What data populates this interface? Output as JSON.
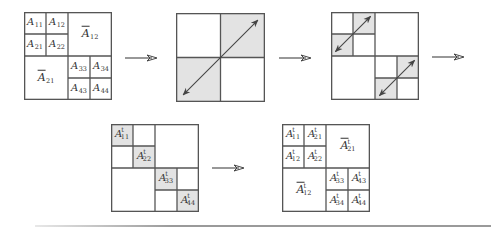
{
  "colors": {
    "line": "#555555",
    "shade": "#e3e3e3",
    "arrow": "#444444",
    "label": "#333333",
    "rule": "#9a9a9a"
  },
  "panels": [
    {
      "id": "step-1-original-blocks",
      "x": 24,
      "y": 12,
      "size": 88,
      "grid": "two-level",
      "shaded": [],
      "diagonal_arrows": [],
      "labels": [
        {
          "base": "A",
          "sub": "11",
          "sup": "",
          "bar": false,
          "cx": 0.125,
          "cy": 0.125
        },
        {
          "base": "A",
          "sub": "12",
          "sup": "",
          "bar": false,
          "cx": 0.375,
          "cy": 0.125
        },
        {
          "base": "A",
          "sub": "21",
          "sup": "",
          "bar": false,
          "cx": 0.125,
          "cy": 0.375
        },
        {
          "base": "A",
          "sub": "22",
          "sup": "",
          "bar": false,
          "cx": 0.375,
          "cy": 0.375
        },
        {
          "base": "A",
          "sub": "12",
          "sup": "",
          "bar": true,
          "cx": 0.75,
          "cy": 0.25,
          "big": true
        },
        {
          "base": "A",
          "sub": "21",
          "sup": "",
          "bar": true,
          "cx": 0.25,
          "cy": 0.75,
          "big": true
        },
        {
          "base": "A",
          "sub": "33",
          "sup": "",
          "bar": false,
          "cx": 0.625,
          "cy": 0.625
        },
        {
          "base": "A",
          "sub": "34",
          "sup": "",
          "bar": false,
          "cx": 0.875,
          "cy": 0.625
        },
        {
          "base": "A",
          "sub": "43",
          "sup": "",
          "bar": false,
          "cx": 0.625,
          "cy": 0.875
        },
        {
          "base": "A",
          "sub": "44",
          "sup": "",
          "bar": false,
          "cx": 0.875,
          "cy": 0.875
        }
      ]
    },
    {
      "id": "step-2-swap-offdiagonal-blocks",
      "x": 176,
      "y": 13,
      "size": 89,
      "grid": "one-level",
      "shaded": [
        [
          0.5,
          0,
          0.5,
          0.5
        ],
        [
          0,
          0.5,
          0.5,
          0.5
        ]
      ],
      "diagonal_arrows": [
        [
          0.08,
          0.92,
          0.92,
          0.08
        ]
      ],
      "labels": []
    },
    {
      "id": "step-3-swap-subblocks",
      "x": 331,
      "y": 12,
      "size": 88,
      "grid": "block-diagonal",
      "shaded": [
        [
          0.25,
          0,
          0.25,
          0.25
        ],
        [
          0,
          0.25,
          0.25,
          0.25
        ],
        [
          0.75,
          0.5,
          0.25,
          0.25
        ],
        [
          0.5,
          0.75,
          0.25,
          0.25
        ]
      ],
      "diagonal_arrows": [
        [
          0.05,
          0.45,
          0.45,
          0.05
        ],
        [
          0.55,
          0.95,
          0.95,
          0.55
        ]
      ],
      "labels": []
    },
    {
      "id": "step-4-transpose-diagonal-blocks",
      "x": 111,
      "y": 124,
      "size": 88,
      "grid": "block-diagonal",
      "shaded": [
        [
          0,
          0,
          0.25,
          0.25
        ],
        [
          0.25,
          0.25,
          0.25,
          0.25
        ],
        [
          0.5,
          0.5,
          0.25,
          0.25
        ],
        [
          0.75,
          0.75,
          0.25,
          0.25
        ]
      ],
      "diagonal_arrows": [],
      "labels": [
        {
          "base": "A",
          "sub": "11",
          "sup": "t",
          "bar": false,
          "cx": 0.125,
          "cy": 0.125
        },
        {
          "base": "A",
          "sub": "22",
          "sup": "t",
          "bar": false,
          "cx": 0.375,
          "cy": 0.375
        },
        {
          "base": "A",
          "sub": "33",
          "sup": "t",
          "bar": false,
          "cx": 0.625,
          "cy": 0.625
        },
        {
          "base": "A",
          "sub": "44",
          "sup": "t",
          "bar": false,
          "cx": 0.875,
          "cy": 0.875
        }
      ]
    },
    {
      "id": "step-5-transposed-result",
      "x": 282,
      "y": 124,
      "size": 88,
      "grid": "two-level",
      "shaded": [],
      "diagonal_arrows": [],
      "labels": [
        {
          "base": "A",
          "sub": "11",
          "sup": "t",
          "bar": false,
          "cx": 0.125,
          "cy": 0.125
        },
        {
          "base": "A",
          "sub": "21",
          "sup": "t",
          "bar": false,
          "cx": 0.375,
          "cy": 0.125
        },
        {
          "base": "A",
          "sub": "12",
          "sup": "t",
          "bar": false,
          "cx": 0.125,
          "cy": 0.375
        },
        {
          "base": "A",
          "sub": "22",
          "sup": "t",
          "bar": false,
          "cx": 0.375,
          "cy": 0.375
        },
        {
          "base": "A",
          "sub": "21",
          "sup": "t",
          "bar": true,
          "cx": 0.75,
          "cy": 0.25,
          "big": true
        },
        {
          "base": "A",
          "sub": "12",
          "sup": "t",
          "bar": true,
          "cx": 0.25,
          "cy": 0.75,
          "big": true
        },
        {
          "base": "A",
          "sub": "33",
          "sup": "t",
          "bar": false,
          "cx": 0.625,
          "cy": 0.625
        },
        {
          "base": "A",
          "sub": "43",
          "sup": "t",
          "bar": false,
          "cx": 0.875,
          "cy": 0.625
        },
        {
          "base": "A",
          "sub": "34",
          "sup": "t",
          "bar": false,
          "cx": 0.625,
          "cy": 0.875
        },
        {
          "base": "A",
          "sub": "44",
          "sup": "t",
          "bar": false,
          "cx": 0.875,
          "cy": 0.875
        }
      ]
    }
  ],
  "flow_arrows": [
    {
      "id": "arrow-step-1-to-2",
      "x1": 125,
      "x2": 156,
      "y": 58
    },
    {
      "id": "arrow-step-2-to-3",
      "x1": 279,
      "x2": 310,
      "y": 58
    },
    {
      "id": "arrow-step-3-to-4",
      "x1": 432,
      "x2": 463,
      "y": 57
    },
    {
      "id": "arrow-step-4-to-5",
      "x1": 212,
      "x2": 243,
      "y": 168
    }
  ]
}
